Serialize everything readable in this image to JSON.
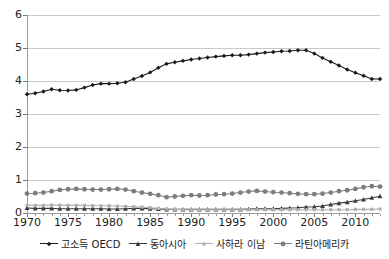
{
  "chart_data": {
    "type": "line",
    "title": "",
    "xlabel": "",
    "ylabel": "",
    "xlim": [
      1970,
      2013
    ],
    "ylim": [
      0,
      6
    ],
    "grid": true,
    "legend_position": "bottom",
    "y_ticks": [
      0,
      1,
      2,
      3,
      4,
      5,
      6
    ],
    "y_tick_labels": [
      "0",
      "1",
      "2",
      "3",
      "4",
      "5",
      "6"
    ],
    "x_ticks": [
      1970,
      1975,
      1980,
      1985,
      1990,
      1995,
      2000,
      2005,
      2010
    ],
    "x_tick_labels": [
      "1970",
      "1975",
      "1980",
      "1985",
      "1990",
      "1995",
      "2000",
      "2005",
      "2010"
    ],
    "x": [
      1970,
      1971,
      1972,
      1973,
      1974,
      1975,
      1976,
      1977,
      1978,
      1979,
      1980,
      1981,
      1982,
      1983,
      1984,
      1985,
      1986,
      1987,
      1988,
      1989,
      1990,
      1991,
      1992,
      1993,
      1994,
      1995,
      1996,
      1997,
      1998,
      1999,
      2000,
      2001,
      2002,
      2003,
      2004,
      2005,
      2006,
      2007,
      2008,
      2009,
      2010,
      2011,
      2012,
      2013
    ],
    "series": [
      {
        "name": "고소득 OECD",
        "color": "#1a1a1a",
        "marker": "diamond",
        "values": [
          3.6,
          3.63,
          3.68,
          3.75,
          3.72,
          3.71,
          3.73,
          3.8,
          3.88,
          3.92,
          3.92,
          3.93,
          3.96,
          4.06,
          4.15,
          4.26,
          4.4,
          4.52,
          4.57,
          4.61,
          4.65,
          4.68,
          4.71,
          4.74,
          4.76,
          4.78,
          4.78,
          4.8,
          4.83,
          4.86,
          4.88,
          4.9,
          4.91,
          4.93,
          4.93,
          4.83,
          4.7,
          4.58,
          4.47,
          4.35,
          4.25,
          4.16,
          4.06,
          4.06
        ]
      },
      {
        "name": "동아시아",
        "color": "#3a3a3a",
        "marker": "triangle",
        "values": [
          0.15,
          0.14,
          0.14,
          0.14,
          0.13,
          0.13,
          0.13,
          0.13,
          0.13,
          0.13,
          0.12,
          0.12,
          0.13,
          0.14,
          0.14,
          0.13,
          0.12,
          0.11,
          0.11,
          0.11,
          0.11,
          0.11,
          0.11,
          0.11,
          0.11,
          0.11,
          0.11,
          0.12,
          0.13,
          0.13,
          0.13,
          0.14,
          0.15,
          0.16,
          0.18,
          0.19,
          0.21,
          0.26,
          0.3,
          0.33,
          0.37,
          0.41,
          0.46,
          0.51
        ]
      },
      {
        "name": "사하라 이남",
        "color": "#b0b0b0",
        "marker": "star",
        "values": [
          0.23,
          0.23,
          0.23,
          0.24,
          0.24,
          0.23,
          0.23,
          0.23,
          0.22,
          0.22,
          0.22,
          0.21,
          0.2,
          0.19,
          0.18,
          0.16,
          0.14,
          0.12,
          0.11,
          0.1,
          0.1,
          0.1,
          0.1,
          0.1,
          0.1,
          0.1,
          0.1,
          0.1,
          0.1,
          0.1,
          0.1,
          0.1,
          0.1,
          0.1,
          0.1,
          0.1,
          0.1,
          0.1,
          0.1,
          0.1,
          0.11,
          0.11,
          0.11,
          0.12
        ]
      },
      {
        "name": "라틴아메리카",
        "color": "#7d7d7d",
        "marker": "circle",
        "values": [
          0.59,
          0.6,
          0.62,
          0.66,
          0.7,
          0.72,
          0.73,
          0.72,
          0.71,
          0.71,
          0.72,
          0.73,
          0.71,
          0.66,
          0.62,
          0.58,
          0.54,
          0.48,
          0.5,
          0.52,
          0.54,
          0.53,
          0.54,
          0.56,
          0.57,
          0.59,
          0.62,
          0.65,
          0.67,
          0.65,
          0.63,
          0.62,
          0.6,
          0.58,
          0.57,
          0.57,
          0.59,
          0.62,
          0.66,
          0.69,
          0.73,
          0.78,
          0.81,
          0.8
        ]
      }
    ]
  },
  "legend": {
    "items": [
      {
        "label": "고소득 OECD"
      },
      {
        "label": "동아시아"
      },
      {
        "label": "사하라 이남"
      },
      {
        "label": "라틴아메리카"
      }
    ]
  }
}
